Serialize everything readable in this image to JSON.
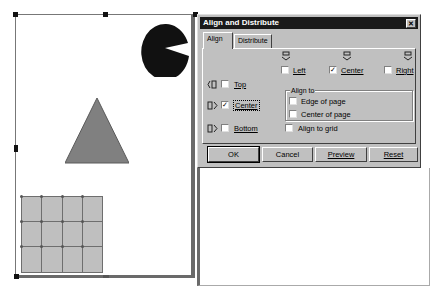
{
  "canvas": {
    "shapes": [
      {
        "type": "pie",
        "color": "#111111"
      },
      {
        "type": "triangle",
        "color": "#808080"
      },
      {
        "type": "grid",
        "rows": 3,
        "cols": 4,
        "color": "#bfbfbf"
      }
    ]
  },
  "dialog": {
    "title": "Align and Distribute",
    "close_label": "✕",
    "tabs": [
      {
        "label": "Align",
        "active": true
      },
      {
        "label": "Distribute",
        "active": false
      }
    ],
    "horizontal": [
      {
        "label": "Left",
        "checked": false,
        "check": ""
      },
      {
        "label": "Center",
        "checked": true,
        "check": "✓"
      },
      {
        "label": "Right",
        "checked": false,
        "check": ""
      }
    ],
    "vertical": [
      {
        "label": "Top",
        "checked": false,
        "check": ""
      },
      {
        "label": "Center",
        "checked": true,
        "check": "✓"
      },
      {
        "label": "Bottom",
        "checked": false,
        "check": ""
      }
    ],
    "align_to": {
      "legend": "Align to",
      "options": [
        {
          "label": "Edge of page",
          "checked": false
        },
        {
          "label": "Center of page",
          "checked": false
        }
      ]
    },
    "align_to_grid": {
      "label": "Align to grid",
      "checked": false
    },
    "buttons": {
      "ok": "OK",
      "cancel": "Cancel",
      "preview": "Preview",
      "reset": "Reset"
    },
    "icons": {
      "h_align": "⛫",
      "v_align": "◫"
    }
  }
}
